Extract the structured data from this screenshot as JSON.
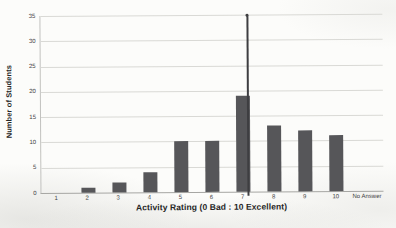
{
  "chart_data": {
    "type": "bar",
    "title": "",
    "xlabel": "Activity Rating (0 Bad : 10 Excellent)",
    "ylabel": "Number of Students",
    "categories": [
      "1",
      "2",
      "3",
      "4",
      "5",
      "6",
      "7",
      "8",
      "9",
      "10",
      "No Answer"
    ],
    "values": [
      0,
      1,
      2,
      4,
      10,
      10,
      19,
      13,
      12,
      11,
      0
    ],
    "ylim": [
      0,
      35
    ],
    "yticks": [
      0,
      5,
      10,
      15,
      20,
      25,
      30,
      35
    ],
    "grid": true,
    "legend": false,
    "bar_color": "#565659",
    "gridline_color": "#d9d9d5",
    "annotation": {
      "type": "vertical-line-with-top-marker",
      "category": "7",
      "from_value": 0,
      "to_value": 35,
      "color": "#3e3e41"
    }
  }
}
